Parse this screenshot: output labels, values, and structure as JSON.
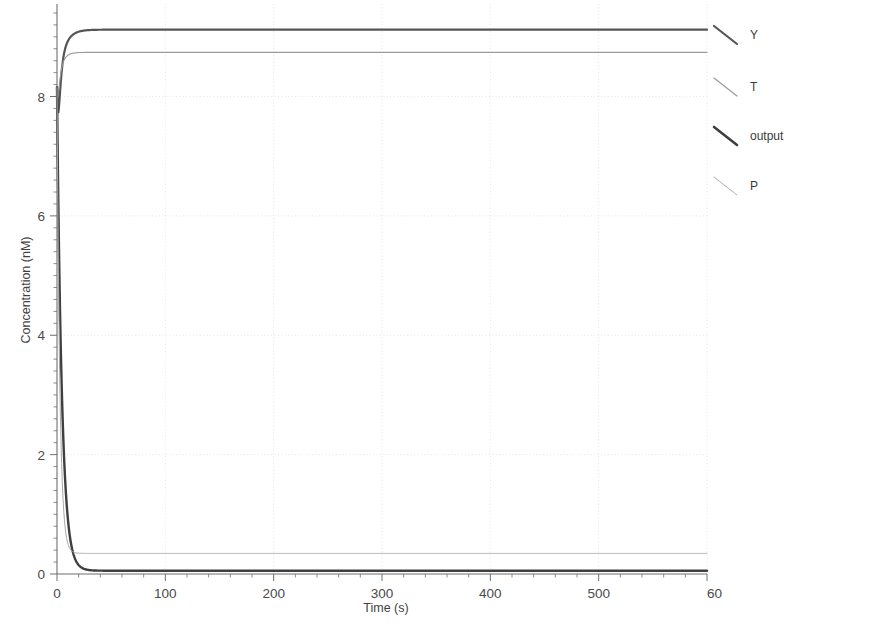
{
  "chart_data": {
    "type": "line",
    "title": "",
    "xlabel": "Time (s)",
    "ylabel": "Concentration (nM)",
    "xlim": [
      0,
      600
    ],
    "ylim": [
      0,
      9.55
    ],
    "xticks": [
      0,
      100,
      200,
      300,
      400,
      500,
      600
    ],
    "xtick_labels": [
      "0",
      "100",
      "200",
      "300",
      "400",
      "500",
      "60"
    ],
    "yticks": [
      0,
      2,
      4,
      6,
      8
    ],
    "ytick_labels": [
      "0",
      "2",
      "4",
      "6",
      "8"
    ],
    "grid": true,
    "grid_style": "dotted",
    "grid_color": "#dedede",
    "legend_position": "right-outside",
    "minor_ticks": true,
    "series": [
      {
        "name": "Y",
        "color": "#555555",
        "width": 2.2,
        "initial": 8.15,
        "steady": 9.12,
        "shape": "rise",
        "tau": 6.0,
        "dip": true,
        "dip_value": 7.55,
        "dip_time": 1.4
      },
      {
        "name": "T",
        "color": "#9a9a9a",
        "width": 1.1,
        "initial": 8.15,
        "steady": 8.74,
        "shape": "rise",
        "tau": 4.0,
        "dip": true,
        "dip_value": 7.9,
        "dip_time": 1.2
      },
      {
        "name": "output",
        "color": "#3f3f3f",
        "width": 2.4,
        "initial": 8.15,
        "steady": 0.055,
        "shape": "decay",
        "tau": 4.5
      },
      {
        "name": "P",
        "color": "#a8a8a8",
        "width": 1.0,
        "initial": 8.15,
        "steady": 0.345,
        "shape": "decay",
        "tau": 2.6
      }
    ]
  },
  "legend": {
    "items": [
      {
        "label": "Y",
        "color": "#555555",
        "width": 2.2
      },
      {
        "label": "T",
        "color": "#9a9a9a",
        "width": 1.2
      },
      {
        "label": "output",
        "color": "#3f3f3f",
        "width": 2.6
      },
      {
        "label": "P",
        "color": "#b0b0b0",
        "width": 1.0
      }
    ]
  },
  "axes": {
    "spine_color": "#6f6f6f",
    "tick_color": "#6f6f6f"
  }
}
